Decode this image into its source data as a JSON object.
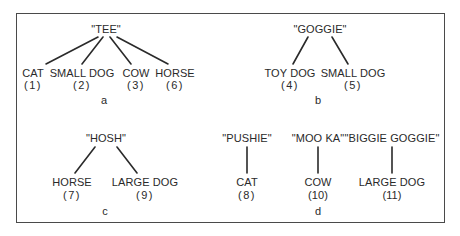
{
  "panels": {
    "a": {
      "label": "a",
      "root": "\"TEE\"",
      "leaves": [
        {
          "name": "CAT",
          "num": "(1)"
        },
        {
          "name": "SMALL DOG",
          "num": "(2)"
        },
        {
          "name": "COW",
          "num": "(3)"
        },
        {
          "name": "HORSE",
          "num": "(6)"
        }
      ]
    },
    "b": {
      "label": "b",
      "root": "\"GOGGIE\"",
      "leaves": [
        {
          "name": "TOY DOG",
          "num": "(4)"
        },
        {
          "name": "SMALL DOG",
          "num": "(5)"
        }
      ]
    },
    "c": {
      "label": "c",
      "root": "\"HOSH\"",
      "leaves": [
        {
          "name": "HORSE",
          "num": "(7)"
        },
        {
          "name": "LARGE DOG",
          "num": "(9)"
        }
      ]
    },
    "d": {
      "label": "d",
      "trees": [
        {
          "root": "\"PUSHIE\"",
          "leaf": "CAT",
          "num": "(8)"
        },
        {
          "root": "\"MOO KA\"",
          "leaf": "COW",
          "num": "(10)"
        },
        {
          "root": "\"BIGGIE GOGGIE\"",
          "leaf": "LARGE DOG",
          "num": "(11)"
        }
      ]
    }
  }
}
